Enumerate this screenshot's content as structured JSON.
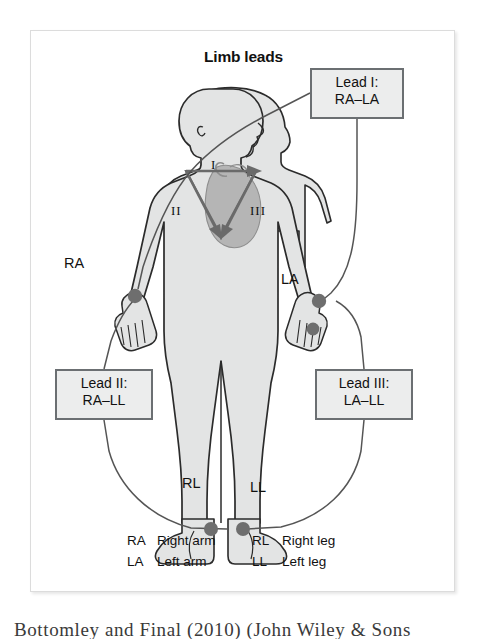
{
  "figure": {
    "title": "Limb leads",
    "panel_background": "#ffffff",
    "panel_border_color": "#dcdcdc"
  },
  "callouts": [
    {
      "id": "lead-1",
      "line1": "Lead I:",
      "line2": "RA–LA",
      "fill": "#eceded",
      "border": "#6b6f72"
    },
    {
      "id": "lead-2",
      "line1": "Lead II:",
      "line2": "RA–LL",
      "fill": "#eceded",
      "border": "#6b6f72"
    },
    {
      "id": "lead-3",
      "line1": "Lead III:",
      "line2": "LA–LL",
      "fill": "#eceded",
      "border": "#6b6f72"
    }
  ],
  "electrodes": [
    {
      "code": "RA",
      "name": "Right arm",
      "site": "right wrist"
    },
    {
      "code": "LA",
      "name": "Left arm",
      "site": "left wrist"
    },
    {
      "code": "RL",
      "name": "Right leg",
      "site": "right ankle"
    },
    {
      "code": "LL",
      "name": "Left leg",
      "site": "left ankle"
    }
  ],
  "triangle": {
    "name": "Einthoven triangle",
    "numerals": [
      "I",
      "II",
      "III"
    ],
    "vector_color": "#6a6a6a"
  },
  "legend": {
    "rows": [
      {
        "left_abbr": "RA",
        "left_term": "Right arm",
        "right_abbr": "RL",
        "right_term": "Right leg"
      },
      {
        "left_abbr": "LA",
        "left_term": "Left arm",
        "right_abbr": "LL",
        "right_term": "Left leg"
      }
    ]
  },
  "caption": {
    "text": "Bottomley and Final (2010) (John Wiley & Sons"
  },
  "colors": {
    "body_fill": "#e3e4e4",
    "body_outline": "#2b2b2b",
    "heart_fill": "#b3b3b3",
    "electrode_dot": "#6e6e6e",
    "wire": "#555555"
  }
}
